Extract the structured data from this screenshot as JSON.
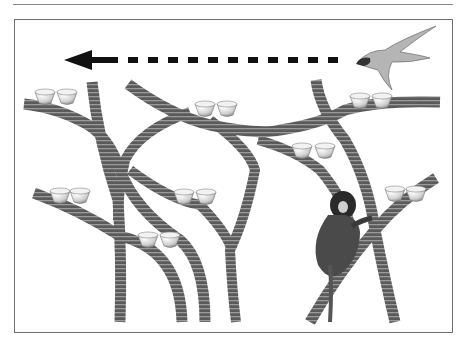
{
  "figure": {
    "elements": {
      "arrow": {
        "direction": "left",
        "style": "dashed",
        "color": "#111111"
      },
      "predator": {
        "type": "bird-of-prey",
        "position": "top-right"
      },
      "forager": {
        "type": "marmoset",
        "position": "lower-right"
      },
      "cup_pairs": 8
    },
    "colors": {
      "branch": "#555555",
      "branch_stripe": "#8c8c8c",
      "frame": "#6e6e6e",
      "cup_fill": "#e8e8e8",
      "cup_shade": "#9a9a9a"
    }
  }
}
